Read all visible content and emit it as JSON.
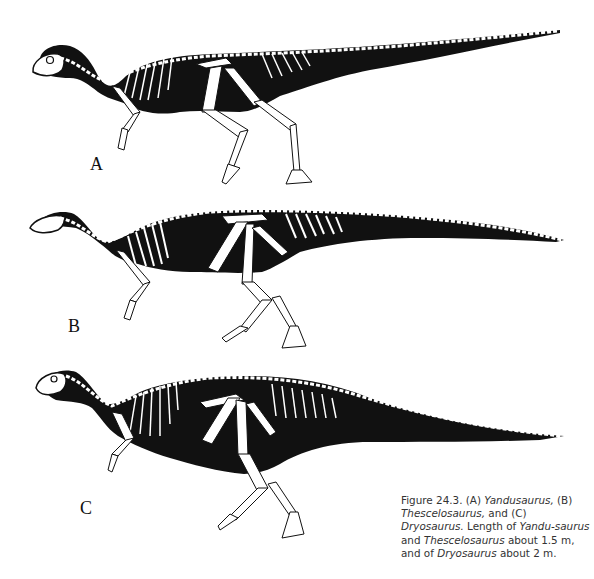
{
  "figure": {
    "panels": [
      {
        "label": "A",
        "taxon": "Yandusaurus"
      },
      {
        "label": "B",
        "taxon": "Thescelosaurus"
      },
      {
        "label": "C",
        "taxon": "Dryosaurus"
      }
    ],
    "caption": {
      "prefix": "Figure 24.3. (A) ",
      "t1": "Yandusaurus,",
      "s1": " (B) ",
      "t2": "Thescelosaurus,",
      "s2": " and (C) ",
      "t3": "Dryosaurus.",
      "s3": " Length of ",
      "t4": "Yandu-saurus",
      "s4": " and ",
      "t5": "Thescelosaurus",
      "s5": " about 1.5 m, and of ",
      "t6": "Dryosaurus",
      "s6": " about 2 m."
    },
    "colors": {
      "ink": "#111111",
      "bone": "#ffffff",
      "paper": "#ffffff"
    }
  }
}
